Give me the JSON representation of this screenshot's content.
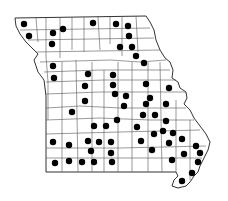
{
  "map": {
    "region": "Missouri",
    "subdivision": "counties",
    "outline_color": "#333333",
    "county_line_color": "#555555",
    "dot_color": "#000000",
    "background": "#ffffff",
    "dot_radius": 3.2,
    "dots": [
      [
        24,
        24
      ],
      [
        29,
        36
      ],
      [
        53,
        33
      ],
      [
        63,
        29
      ],
      [
        52,
        44
      ],
      [
        53,
        66
      ],
      [
        54,
        78
      ],
      [
        93,
        23
      ],
      [
        116,
        24
      ],
      [
        128,
        26
      ],
      [
        129,
        36
      ],
      [
        120,
        47
      ],
      [
        132,
        47
      ],
      [
        136,
        56
      ],
      [
        144,
        63
      ],
      [
        88,
        74
      ],
      [
        113,
        75
      ],
      [
        85,
        86
      ],
      [
        113,
        85
      ],
      [
        146,
        84
      ],
      [
        169,
        88
      ],
      [
        115,
        94
      ],
      [
        126,
        96
      ],
      [
        150,
        98
      ],
      [
        85,
        101
      ],
      [
        72,
        112
      ],
      [
        124,
        106
      ],
      [
        146,
        104
      ],
      [
        166,
        104
      ],
      [
        117,
        120
      ],
      [
        143,
        115
      ],
      [
        155,
        115
      ],
      [
        166,
        121
      ],
      [
        94,
        126
      ],
      [
        106,
        126
      ],
      [
        137,
        127
      ],
      [
        53,
        142
      ],
      [
        69,
        145
      ],
      [
        88,
        141
      ],
      [
        99,
        142
      ],
      [
        111,
        142
      ],
      [
        154,
        134
      ],
      [
        163,
        131
      ],
      [
        173,
        133
      ],
      [
        141,
        141
      ],
      [
        169,
        143
      ],
      [
        182,
        139
      ],
      [
        91,
        151
      ],
      [
        111,
        153
      ],
      [
        152,
        150
      ],
      [
        196,
        146
      ],
      [
        184,
        154
      ],
      [
        200,
        153
      ],
      [
        172,
        160
      ],
      [
        198,
        162
      ],
      [
        55,
        163
      ],
      [
        69,
        161
      ],
      [
        82,
        162
      ],
      [
        94,
        162
      ],
      [
        112,
        162
      ],
      [
        192,
        173
      ],
      [
        182,
        181
      ]
    ]
  }
}
